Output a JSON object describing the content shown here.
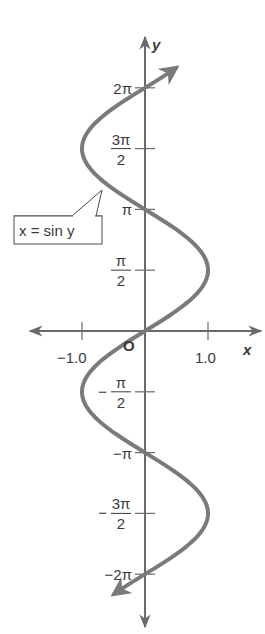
{
  "chart_data": {
    "type": "line",
    "title": "",
    "equation_label": "x = sin y",
    "xlabel": "x",
    "ylabel": "y",
    "origin_label": "O",
    "xlim": [
      -1.3,
      1.5
    ],
    "ylim": [
      -7.1,
      7.1
    ],
    "x_ticks": [
      {
        "value": -1.0,
        "label": "−1.0"
      },
      {
        "value": 1.0,
        "label": "1.0"
      }
    ],
    "y_ticks": [
      {
        "value": 6.2832,
        "label": "2π"
      },
      {
        "value": 4.7124,
        "label": "3π/2",
        "num": "3π",
        "den": "2"
      },
      {
        "value": 3.1416,
        "label": "π"
      },
      {
        "value": 1.5708,
        "label": "π/2",
        "num": "π",
        "den": "2"
      },
      {
        "value": -1.5708,
        "label": "−π/2",
        "num": "π",
        "den": "2",
        "neg": "−"
      },
      {
        "value": -3.1416,
        "label": "−π"
      },
      {
        "value": -4.7124,
        "label": "−3π/2",
        "num": "3π",
        "den": "2",
        "neg": "−"
      },
      {
        "value": -6.2832,
        "label": "−2π"
      }
    ],
    "series": [
      {
        "name": "x = sin y",
        "function": "x = sin(y)",
        "y_range": [
          -6.8,
          6.8
        ],
        "points": [
          {
            "y": -2.0944,
            "x": -0.866
          },
          {
            "y": -1.5708,
            "x": -1.0
          },
          {
            "y": 0,
            "x": 0
          },
          {
            "y": 1.5708,
            "x": 1.0
          },
          {
            "y": 3.1416,
            "x": 0
          },
          {
            "y": 4.7124,
            "x": -1.0
          },
          {
            "y": 6.2832,
            "x": 0
          },
          {
            "y": -3.1416,
            "x": 0
          },
          {
            "y": -4.7124,
            "x": 1.0
          },
          {
            "y": -6.2832,
            "x": 0
          }
        ]
      }
    ],
    "grid": false,
    "legend": "none",
    "colors": {
      "curve": "#7a7a7a",
      "axes": "#6a6a6a",
      "text": "#3a3a3a"
    }
  }
}
